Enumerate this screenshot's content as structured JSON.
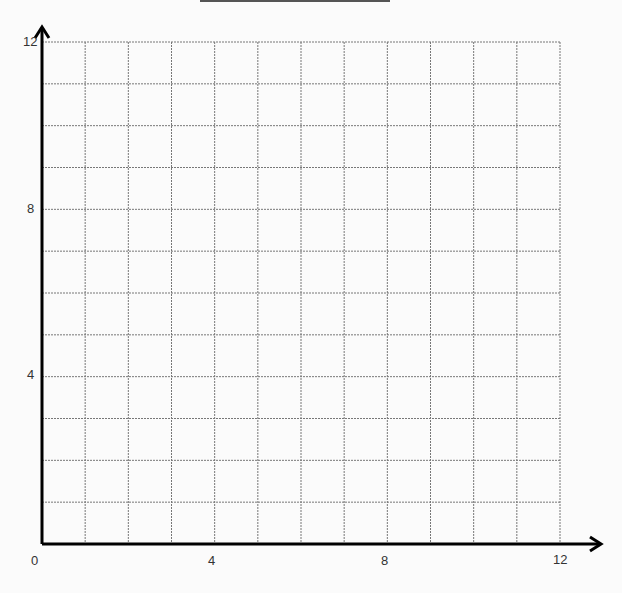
{
  "chart_data": {
    "type": "scatter",
    "title": "",
    "xlabel": "",
    "ylabel": "",
    "xlim": [
      0,
      12
    ],
    "ylim": [
      0,
      12
    ],
    "grid": true,
    "grid_step": 1,
    "grid_style": "dashed",
    "x_tick_labels": [
      "0",
      "4",
      "8",
      "12"
    ],
    "y_tick_labels": [
      "4",
      "8",
      "12"
    ],
    "series": [],
    "legend": null
  },
  "labels": {
    "origin": "0",
    "x4": "4",
    "x8": "8",
    "x12": "12",
    "y4": "4",
    "y8": "8",
    "y12": "12"
  }
}
